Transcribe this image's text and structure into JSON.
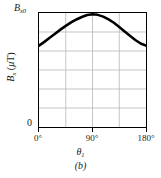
{
  "figure": {
    "caption": "(b)",
    "panel_letter": "b"
  },
  "chart_data": {
    "type": "line",
    "title": "",
    "subtitle": "",
    "xlabel": "θ₁",
    "xlabel_base": "θ",
    "xlabel_sub": "1",
    "ylabel": "Bₓ (μT)",
    "ylabel_base": "B",
    "ylabel_sub": "x",
    "ylabel_units": "(μT)",
    "y_max_label": "B",
    "y_max_label_sub": "x0",
    "y_zero_label": "0",
    "x_tick_labels": [
      "0°",
      "90°",
      "180°"
    ],
    "x_tick_values": [
      0,
      90,
      180
    ],
    "xlim": [
      0,
      180
    ],
    "ylim": [
      0,
      1
    ],
    "grid": true,
    "grid_columns": 4,
    "grid_rows": 6,
    "legend": "none",
    "series": [
      {
        "name": "Bx vs theta1",
        "x": [
          0,
          9,
          18,
          27,
          36,
          45,
          54,
          63,
          72,
          81,
          90,
          99,
          108,
          117,
          126,
          135,
          144,
          153,
          162,
          171,
          180
        ],
        "y": [
          0.722,
          0.755,
          0.791,
          0.828,
          0.864,
          0.897,
          0.928,
          0.954,
          0.976,
          0.993,
          1.0,
          0.995,
          0.979,
          0.955,
          0.925,
          0.888,
          0.848,
          0.809,
          0.772,
          0.741,
          0.722
        ]
      }
    ],
    "annotations": [
      {
        "text": "B_x0",
        "position": "y-axis-top",
        "meaning": "maximum value of Bx"
      },
      {
        "text": "0",
        "position": "y-axis-bottom",
        "meaning": "origin"
      }
    ],
    "curve_endpoint_fraction": 0.722,
    "curve_peak_x_deg": 88
  },
  "colors": {
    "curve": "#000000",
    "axis": "#000000",
    "grid": "#b5b5b5",
    "background": "#ffffff",
    "text": "#1a1a1a"
  }
}
